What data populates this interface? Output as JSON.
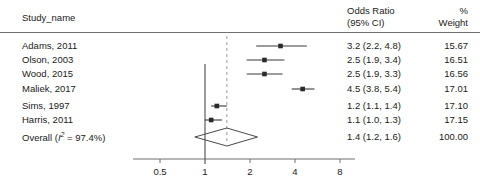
{
  "header": {
    "study_col": "Study_name",
    "or_col_line1": "Odds Ratio",
    "or_col_line2": "(95% CI)",
    "weight_col_line1": "%",
    "weight_col_line2": "Weight"
  },
  "rows": [
    {
      "study": "Adams, 2011",
      "or_text": "3.2 (2.2, 4.8)",
      "weight": "15.67",
      "or": 3.2,
      "lcl": 2.2,
      "ucl": 4.8,
      "marker": "square"
    },
    {
      "study": "Olson, 2003",
      "or_text": "2.5 (1.9, 3.4)",
      "weight": "16.51",
      "or": 2.5,
      "lcl": 1.9,
      "ucl": 3.4,
      "marker": "square"
    },
    {
      "study": "Wood, 2015",
      "or_text": "2.5 (1.9, 3.3)",
      "weight": "16.56",
      "or": 2.5,
      "lcl": 1.9,
      "ucl": 3.3,
      "marker": "square"
    },
    {
      "study": "Maliek, 2017",
      "or_text": "4.5 (3.8, 5.4)",
      "weight": "17.01",
      "or": 4.5,
      "lcl": 3.8,
      "ucl": 5.4,
      "marker": "square"
    },
    {
      "study": "Sims, 1997",
      "or_text": "1.2 (1.1, 1.4)",
      "weight": "17.10",
      "or": 1.2,
      "lcl": 1.1,
      "ucl": 1.4,
      "marker": "square"
    },
    {
      "study": "Harris, 2011",
      "or_text": "1.1 (1.0, 1.3)",
      "weight": "17.15",
      "or": 1.1,
      "lcl": 1.0,
      "ucl": 1.3,
      "marker": "square"
    }
  ],
  "overall": {
    "label_prefix": "Overall (",
    "label_i": "I",
    "label_sup": "2",
    "label_suffix": " = 97.4%)",
    "study": "Overall (I2 = 97.4%)",
    "or_text": "1.4 (1.2, 1.6)",
    "weight": "100.00",
    "or": 1.4,
    "lcl": 1.2,
    "ucl": 1.6,
    "marker": "diamond",
    "heterogeneity_i2": "97.4%"
  },
  "axis": {
    "scale": "log",
    "ticks": [
      "0.5",
      "1",
      "2",
      "4",
      "8"
    ],
    "tick_values": [
      0.5,
      1,
      2,
      4,
      8
    ],
    "null_value": 1,
    "pooled_ref_value": 1.4
  },
  "chart_data": {
    "type": "forest",
    "title": "",
    "xlabel": "",
    "ylabel": "",
    "xscale": "log",
    "xlim": [
      0.4,
      9.5
    ],
    "xticks": [
      0.5,
      1,
      2,
      4,
      8
    ],
    "xticklabels": [
      "0.5",
      "1",
      "2",
      "4",
      "8"
    ],
    "grid": false,
    "legend": "none",
    "effect_measure": "Odds Ratio",
    "ci_level": "95%",
    "null_line": 1,
    "pooled_line": 1.4,
    "categories": [
      "Adams, 2011",
      "Olson, 2003",
      "Wood, 2015",
      "Maliek, 2017",
      "Sims, 1997",
      "Harris, 2011",
      "Overall (I2 = 97.4%)"
    ],
    "values": [
      3.2,
      2.5,
      2.5,
      4.5,
      1.2,
      1.1,
      1.4
    ],
    "ci_lower": [
      2.2,
      1.9,
      1.9,
      3.8,
      1.1,
      1.0,
      1.2
    ],
    "ci_upper": [
      4.8,
      3.4,
      3.3,
      5.4,
      1.4,
      1.3,
      1.6
    ],
    "weights": [
      15.67,
      16.51,
      16.56,
      17.01,
      17.1,
      17.15,
      100.0
    ],
    "heterogeneity": "I2 = 97.4%"
  }
}
